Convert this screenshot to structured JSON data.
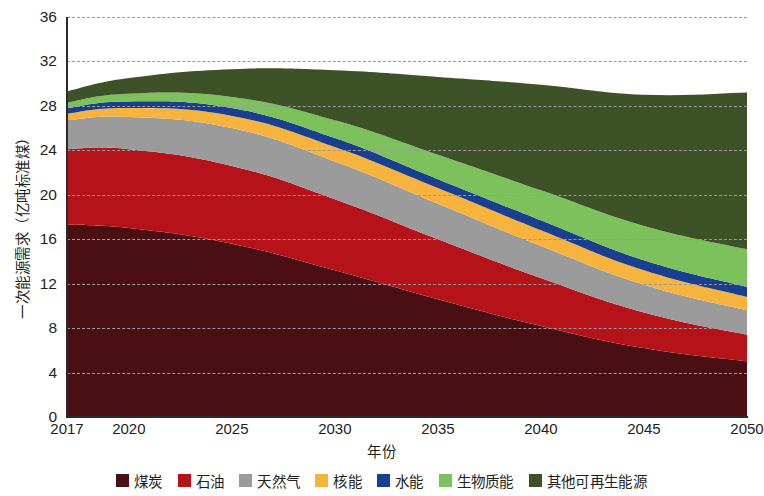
{
  "chart": {
    "type": "area",
    "xlabel": "年份",
    "ylabel": "一次能源需求（亿吨标准煤）"
  },
  "axis": {
    "y_ticks": [
      "0",
      "4",
      "8",
      "12",
      "16",
      "20",
      "24",
      "28",
      "32",
      "36"
    ],
    "x_ticks": [
      "2017",
      "2020",
      "2025",
      "2030",
      "2035",
      "2040",
      "2045",
      "2050"
    ]
  },
  "legend": {
    "items": [
      {
        "label": "煤炭",
        "color": "#4a0f13"
      },
      {
        "label": "石油",
        "color": "#b51319"
      },
      {
        "label": "天然气",
        "color": "#9b9b9b"
      },
      {
        "label": "核能",
        "color": "#f6b githubusercontent"
      },
      {
        "label": "水能",
        "color": "#1b3f8f"
      },
      {
        "label": "生物质能",
        "color": "#7cc15c"
      },
      {
        "label": "其他可再生能源",
        "color": "#3e5227"
      }
    ]
  },
  "chart_data": {
    "type": "area",
    "stacked": true,
    "title": "",
    "xlabel": "年份",
    "ylabel": "一次能源需求（亿吨标准煤）",
    "ylim": [
      0,
      36
    ],
    "yticks": [
      0,
      4,
      8,
      12,
      16,
      20,
      24,
      28,
      32,
      36
    ],
    "grid": true,
    "legend_position": "bottom",
    "x": [
      2017,
      2020,
      2025,
      2030,
      2035,
      2040,
      2045,
      2050
    ],
    "xtick_labels": [
      "2017",
      "2020",
      "2025",
      "2030",
      "2035",
      "2040",
      "2045",
      "2050"
    ],
    "series": [
      {
        "name": "煤炭",
        "color": "#4a0f13",
        "values": [
          17.3,
          17.0,
          15.6,
          13.2,
          10.6,
          8.2,
          6.2,
          5.0
        ]
      },
      {
        "name": "石油",
        "color": "#b51319",
        "values": [
          6.8,
          7.1,
          7.0,
          6.4,
          5.4,
          4.3,
          3.2,
          2.4
        ]
      },
      {
        "name": "天然气",
        "color": "#9b9b9b",
        "values": [
          2.6,
          2.9,
          3.4,
          3.4,
          3.2,
          2.9,
          2.5,
          2.2
        ]
      },
      {
        "name": "核能",
        "color": "#f6b33d",
        "values": [
          0.6,
          0.8,
          1.1,
          1.3,
          1.4,
          1.4,
          1.3,
          1.2
        ]
      },
      {
        "name": "水能",
        "color": "#1b3f8f",
        "values": [
          0.5,
          0.6,
          0.7,
          0.8,
          0.8,
          0.9,
          0.9,
          0.9
        ]
      },
      {
        "name": "生物质能",
        "color": "#7cc15c",
        "values": [
          0.5,
          0.7,
          1.0,
          1.6,
          2.2,
          2.7,
          3.1,
          3.4
        ]
      },
      {
        "name": "其他可再生能源",
        "color": "#3e5227",
        "values": [
          1.0,
          1.4,
          2.5,
          4.5,
          7.0,
          9.5,
          11.8,
          14.1
        ]
      }
    ],
    "totals": [
      29.3,
      30.5,
      31.3,
      31.2,
      30.6,
      29.9,
      29.0,
      29.2
    ]
  }
}
